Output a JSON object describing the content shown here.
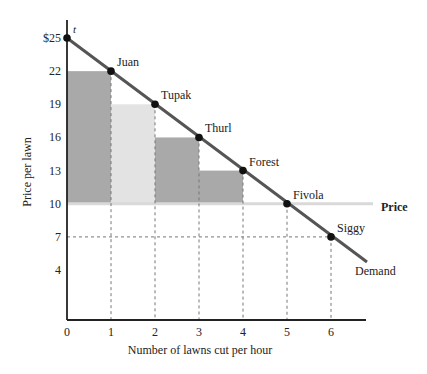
{
  "chart_data": {
    "type": "bar",
    "title": "",
    "xlabel": "Number of lawns cut per hour",
    "ylabel": "Price per lawn",
    "xlim": [
      0,
      6.8
    ],
    "ylim": [
      0,
      25
    ],
    "x_ticks": [
      "0",
      "1",
      "2",
      "3",
      "4",
      "5",
      "6"
    ],
    "y_ticks": [
      {
        "value": 25,
        "label": "$25"
      },
      {
        "value": 22,
        "label": "22"
      },
      {
        "value": 19,
        "label": "19"
      },
      {
        "value": 16,
        "label": "16"
      },
      {
        "value": 13,
        "label": "13"
      },
      {
        "value": 10,
        "label": "10"
      },
      {
        "value": 7,
        "label": "7"
      },
      {
        "value": 4,
        "label": "4"
      }
    ],
    "grid": false,
    "price_level": 10,
    "price_label": "Price",
    "demand_label": "Demand",
    "demand_line": {
      "x0": 0,
      "y0": 25,
      "x1": 6.8,
      "y1": 4.6
    },
    "origin_point_label": "t",
    "buyers": [
      {
        "name": "Juan",
        "quantity": 1,
        "willingness_to_pay": 22
      },
      {
        "name": "Tupak",
        "quantity": 2,
        "willingness_to_pay": 19
      },
      {
        "name": "Thurl",
        "quantity": 3,
        "willingness_to_pay": 16
      },
      {
        "name": "Forest",
        "quantity": 4,
        "willingness_to_pay": 13
      },
      {
        "name": "Fivola",
        "quantity": 5,
        "willingness_to_pay": 10
      },
      {
        "name": "Siggy",
        "quantity": 6,
        "willingness_to_pay": 7
      }
    ],
    "surplus_bars": [
      {
        "x_start": 0,
        "x_end": 1,
        "bottom": 10,
        "top": 22,
        "color": "#a9a9a9"
      },
      {
        "x_start": 1,
        "x_end": 2,
        "bottom": 10,
        "top": 19,
        "color": "#e3e3e3"
      },
      {
        "x_start": 2,
        "x_end": 3,
        "bottom": 10,
        "top": 16,
        "color": "#a9a9a9"
      },
      {
        "x_start": 3,
        "x_end": 4,
        "bottom": 10,
        "top": 13,
        "color": "#a9a9a9"
      }
    ],
    "colors": {
      "demand": "#555555",
      "price": "#d9d9d9",
      "axis": "#222222",
      "dotted": "#777777"
    }
  }
}
